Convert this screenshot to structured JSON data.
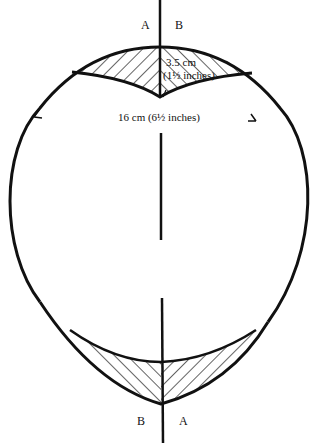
{
  "diagram": {
    "type": "sewing-pattern-piece",
    "labels": {
      "top_left": "A",
      "top_right": "B",
      "bottom_left": "B",
      "bottom_right": "A",
      "dart_depth_line1": "3.5 cm",
      "dart_depth_line2": "(1½ inches)",
      "width": "16 cm (6½ inches)"
    },
    "colors": {
      "stroke": "#111111",
      "background": "#ffffff"
    }
  }
}
